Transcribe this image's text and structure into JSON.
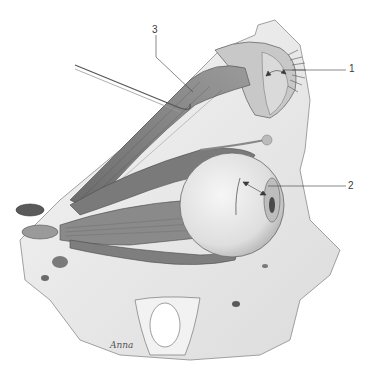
{
  "figure": {
    "type": "anatomical-illustration",
    "style": "grayscale pencil drawing",
    "colors": {
      "background": "#ffffff",
      "bone": "#eeeeee",
      "muscle_dark": "#5a5a5a",
      "muscle_mid": "#8a8a8a",
      "eyeball": "#e6e6e6",
      "line": "#3a3a3a"
    },
    "labels": [
      {
        "number": "1",
        "target": "eyelid / tarsal region (double-headed arrow)"
      },
      {
        "number": "2",
        "target": "eyeball / cornea (double-headed arrow)"
      },
      {
        "number": "3",
        "target": "levator palpebrae superioris lifted by probe"
      }
    ],
    "signature": "Anna"
  }
}
